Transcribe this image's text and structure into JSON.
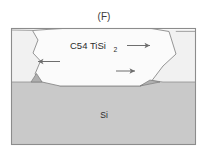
{
  "figure": {
    "panel_label": "(F)",
    "background_color": "#ffffff",
    "frame": {
      "stroke_color": "#8c8c8c",
      "fill_color": "#fcfcfc"
    },
    "layers": [
      {
        "id": "film",
        "label": "",
        "description": "thin silicide film matrix on both sides of the grain",
        "fill_color": "#f4f4f4",
        "stroke_color": "#9a9a9a"
      },
      {
        "id": "grain",
        "label": "C54 TiSi",
        "label_subscript": "2",
        "description": "large faceted C54 TiSi2 grain spanning the film and bulging above the surface",
        "fill_color": "#fbfbfb",
        "stroke_color": "#8a8a8a"
      },
      {
        "id": "substrate",
        "label": "Si",
        "description": "silicon substrate below the film",
        "fill_color": "#c9c9c9",
        "stroke_color": "#8a8a8a"
      },
      {
        "id": "groove-left",
        "label": "",
        "description": "triangular interfacial groove at the left grain boundary",
        "fill_color": "#b4b4b4",
        "stroke_color": "#7d7d7d"
      },
      {
        "id": "groove-right",
        "label": "",
        "description": "triangular interfacial groove at the right grain boundary",
        "fill_color": "#b4b4b4",
        "stroke_color": "#7d7d7d"
      }
    ],
    "arrows": [
      {
        "id": "arrow-upper-right",
        "direction": "right",
        "meaning": "lateral grain growth toward the right near the film surface",
        "color": "#6e6e6e"
      },
      {
        "id": "arrow-left",
        "direction": "left",
        "meaning": "lateral grain growth toward the left at mid film depth",
        "color": "#6e6e6e"
      },
      {
        "id": "arrow-lower-right",
        "direction": "right",
        "meaning": "lateral grain growth toward the right near the substrate interface",
        "color": "#6e6e6e"
      }
    ]
  }
}
